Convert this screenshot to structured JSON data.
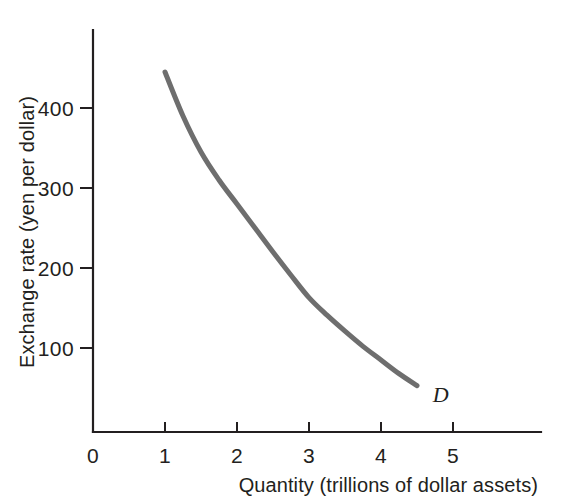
{
  "chart_data": {
    "type": "line",
    "title": "",
    "subtitle": "",
    "xlabel": "Quantity (trillions of dollar assets)",
    "ylabel": "Exchange rate (yen per dollar)",
    "xlim": [
      0,
      6.2
    ],
    "ylim": [
      0,
      520
    ],
    "grid": false,
    "legend_position": "none",
    "x_ticks": [
      {
        "value": 0,
        "label": "0"
      },
      {
        "value": 1,
        "label": "1"
      },
      {
        "value": 2,
        "label": "2"
      },
      {
        "value": 3,
        "label": "3"
      },
      {
        "value": 4,
        "label": "4"
      },
      {
        "value": 5,
        "label": "5"
      }
    ],
    "y_ticks": [
      {
        "value": 100,
        "label": "100"
      },
      {
        "value": 200,
        "label": "200"
      },
      {
        "value": 300,
        "label": "300"
      },
      {
        "value": 400,
        "label": "400"
      }
    ],
    "origin_label": "0",
    "series": [
      {
        "name": "D",
        "annotation": "D",
        "color": "#6e6e6e",
        "line_width": 5,
        "x": [
          1.0,
          1.25,
          1.5,
          1.75,
          2.0,
          2.25,
          2.5,
          2.75,
          3.0,
          3.25,
          3.5,
          3.75,
          4.0,
          4.25,
          4.5
        ],
        "values": [
          450,
          395,
          350,
          315,
          285,
          255,
          225,
          196,
          168,
          146,
          126,
          107,
          90,
          73,
          58
        ]
      }
    ],
    "annotations": [
      {
        "text": "D",
        "x": 4.72,
        "y": 38,
        "style": "italic"
      }
    ],
    "axis_color": "#231f20",
    "background_color": "#ffffff"
  },
  "figure": {
    "curve_label": "D"
  }
}
